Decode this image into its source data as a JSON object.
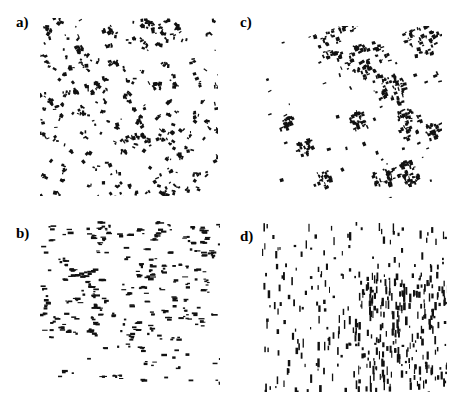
{
  "figure": {
    "background": "#ffffff",
    "ink": "#111111",
    "panels": [
      {
        "id": "a",
        "label": "a)",
        "label_pos": [
          16,
          14
        ],
        "box": [
          40,
          18,
          178,
          178
        ],
        "pattern": "uniform-small-clusters",
        "seed": 11,
        "count": 230,
        "cluster_size": [
          1,
          4
        ],
        "orientation": "random",
        "density_bias": "none"
      },
      {
        "id": "b",
        "label": "b)",
        "label_pos": [
          16,
          225
        ],
        "box": [
          40,
          220,
          180,
          170
        ],
        "pattern": "sparse-scattered-clusters",
        "seed": 23,
        "count": 210,
        "cluster_size": [
          1,
          3
        ],
        "orientation": "horizontal",
        "density_bias": "top"
      },
      {
        "id": "c",
        "label": "c)",
        "label_pos": [
          240,
          14
        ],
        "box": [
          262,
          26,
          180,
          172
        ],
        "pattern": "large-aggregates",
        "seed": 37,
        "aggregates": [
          [
            95,
            10,
            18
          ],
          [
            130,
            40,
            14
          ],
          [
            200,
            15,
            14
          ],
          [
            160,
            75,
            12
          ],
          [
            180,
            115,
            10
          ],
          [
            120,
            110,
            8
          ],
          [
            50,
            140,
            6
          ],
          [
            180,
            170,
            10
          ],
          [
            150,
            175,
            8
          ],
          [
            75,
            180,
            6
          ],
          [
            30,
            115,
            5
          ],
          [
            215,
            120,
            6
          ]
        ],
        "count": 320,
        "orientation": "diagonal"
      },
      {
        "id": "d",
        "label": "d)",
        "label_pos": [
          240,
          228
        ],
        "box": [
          262,
          222,
          185,
          170
        ],
        "pattern": "vertical-streaks",
        "seed": 53,
        "count": 420,
        "orientation": "vertical",
        "density_bias": "bottom-right"
      }
    ]
  }
}
